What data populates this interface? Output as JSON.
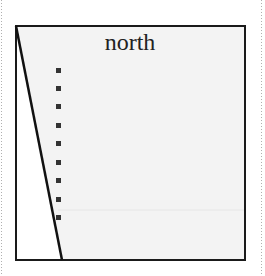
{
  "diagram": {
    "title": "north",
    "colors": {
      "background": "#ffffff",
      "panel_fill": "#f3f3f3",
      "border": "#1a1a1a",
      "marker": "#333333",
      "guide": "#e6e6e6",
      "dotted_edge": "#b0b0b0"
    },
    "frame": {
      "x": 16,
      "y": 26,
      "width": 229,
      "height": 234
    },
    "diagonal_line": {
      "x1": 16,
      "y1": 26,
      "x2": 62,
      "y2": 260
    },
    "markers": [
      {
        "x": 58,
        "y": 70
      },
      {
        "x": 58,
        "y": 88
      },
      {
        "x": 58,
        "y": 106
      },
      {
        "x": 58,
        "y": 125
      },
      {
        "x": 58,
        "y": 143
      },
      {
        "x": 58,
        "y": 162
      },
      {
        "x": 58,
        "y": 180
      },
      {
        "x": 58,
        "y": 199
      },
      {
        "x": 58,
        "y": 217
      }
    ],
    "guide_line_y": 210
  }
}
